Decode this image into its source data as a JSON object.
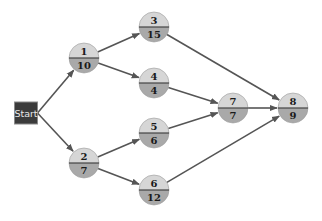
{
  "diagram": {
    "type": "activity-network",
    "colors": {
      "node_top": "#d6d6d6",
      "node_bottom": "#a9a9a9",
      "node_divider": "#444444",
      "edge": "#555555",
      "start_fill": "#3b3b3b",
      "start_border": "#8a8a8a",
      "start_text": "#e8e8e8"
    },
    "start": {
      "id": "start",
      "label": "Start",
      "x": 26,
      "y": 113,
      "w": 23,
      "h": 22
    },
    "nodes": [
      {
        "id": "1",
        "label": "1",
        "value": "10",
        "x": 84,
        "y": 58
      },
      {
        "id": "2",
        "label": "2",
        "value": "7",
        "x": 84,
        "y": 163
      },
      {
        "id": "3",
        "label": "3",
        "value": "15",
        "x": 154,
        "y": 27
      },
      {
        "id": "4",
        "label": "4",
        "value": "4",
        "x": 154,
        "y": 83
      },
      {
        "id": "5",
        "label": "5",
        "value": "6",
        "x": 154,
        "y": 133
      },
      {
        "id": "6",
        "label": "6",
        "value": "12",
        "x": 154,
        "y": 190
      },
      {
        "id": "7",
        "label": "7",
        "value": "7",
        "x": 233,
        "y": 108
      },
      {
        "id": "8",
        "label": "8",
        "value": "9",
        "x": 293,
        "y": 108
      }
    ],
    "edges": [
      {
        "from": "start",
        "to": "1"
      },
      {
        "from": "start",
        "to": "2"
      },
      {
        "from": "1",
        "to": "3"
      },
      {
        "from": "1",
        "to": "4"
      },
      {
        "from": "2",
        "to": "5"
      },
      {
        "from": "2",
        "to": "6"
      },
      {
        "from": "3",
        "to": "8"
      },
      {
        "from": "4",
        "to": "7"
      },
      {
        "from": "5",
        "to": "7"
      },
      {
        "from": "7",
        "to": "8"
      },
      {
        "from": "6",
        "to": "8"
      }
    ],
    "node_radius": 15
  }
}
